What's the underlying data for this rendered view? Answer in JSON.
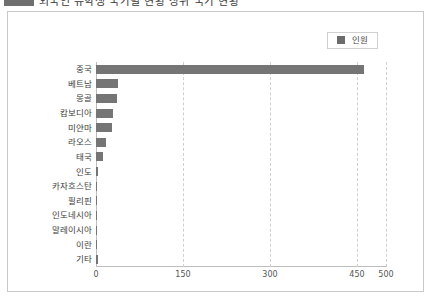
{
  "header": {
    "badge_icon": "filled-rect-icon",
    "title": "외국인 유학생 국가별 현황 상위 국가 현황"
  },
  "legend": {
    "position": "top-right",
    "swatch_color": "#6b6b6b",
    "label": "인원"
  },
  "chart_data": {
    "type": "bar",
    "orientation": "horizontal",
    "title": "",
    "xlabel": "",
    "ylabel": "",
    "categories": [
      "중국",
      "베트남",
      "몽골",
      "캄보디아",
      "미얀마",
      "라오스",
      "태국",
      "인도",
      "카자흐스탄",
      "필리핀",
      "인도네시아",
      "말레이시아",
      "이란",
      "기타"
    ],
    "values": [
      462,
      38,
      36,
      29,
      27,
      18,
      12,
      4,
      2,
      2,
      2,
      1,
      1,
      3
    ],
    "series": [
      {
        "name": "인원",
        "values": [
          462,
          38,
          36,
          29,
          27,
          18,
          12,
          4,
          2,
          2,
          2,
          1,
          1,
          3
        ],
        "color": "#757575"
      }
    ],
    "xlim": [
      0,
      500
    ],
    "xticks": [
      0,
      150,
      300,
      450,
      500
    ],
    "xtick_labels": [
      "0",
      "150",
      "300",
      "450",
      "500"
    ],
    "grid": "vertical-dashed",
    "legend_position": "top-right"
  }
}
